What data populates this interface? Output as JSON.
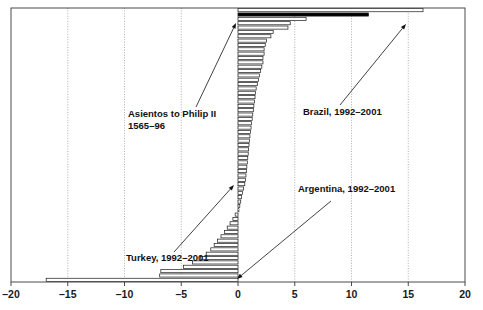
{
  "chart_data": {
    "type": "bar",
    "orientation": "horizontal",
    "title": "",
    "subtitle": "",
    "xlabel": "",
    "ylabel": "",
    "xlim": [
      -20,
      20
    ],
    "xticks": [
      -20,
      -15,
      -10,
      -5,
      0,
      5,
      10,
      15,
      20
    ],
    "xticklabels": [
      "–20",
      "–15",
      "–10",
      "–5",
      "0",
      "5",
      "10",
      "15",
      "20"
    ],
    "grid": "vertical-dotted",
    "legend": "none",
    "bar_fill": "#ffffff",
    "bar_edge": "#1a1a1a",
    "highlight_fill": "#000000",
    "categories": [
      "r01",
      "r02",
      "r03",
      "r04",
      "r05",
      "r06",
      "r07",
      "r08",
      "r09",
      "r10",
      "r11",
      "r12",
      "r13",
      "r14",
      "r15",
      "r16",
      "r17",
      "r18",
      "r19",
      "r20",
      "r21",
      "r22",
      "r23",
      "r24",
      "r25",
      "r26",
      "r27",
      "r28",
      "r29",
      "r30",
      "r31",
      "r32",
      "r33",
      "r34",
      "r35",
      "r36",
      "r37",
      "r38",
      "r39",
      "r40",
      "r41",
      "r42",
      "r43",
      "r44",
      "r45",
      "r46",
      "r47",
      "r48",
      "r49",
      "r50",
      "r51",
      "r52",
      "r53",
      "r54",
      "r55",
      "r56",
      "r57",
      "r58",
      "r59",
      "r60",
      "r61",
      "r62",
      "r63"
    ],
    "values": [
      16.3,
      11.5,
      6.0,
      4.6,
      4.4,
      3.1,
      2.9,
      2.5,
      2.4,
      2.3,
      2.3,
      2.2,
      2.2,
      2.1,
      2.0,
      1.9,
      1.8,
      1.7,
      1.6,
      1.55,
      1.5,
      1.45,
      1.4,
      1.35,
      1.3,
      1.25,
      1.2,
      1.15,
      1.1,
      1.05,
      1.0,
      0.97,
      0.94,
      0.9,
      0.86,
      0.82,
      0.78,
      0.74,
      0.7,
      0.66,
      0.6,
      0.5,
      0.4,
      0.32,
      0.24,
      0.16,
      0.08,
      -0.25,
      -0.45,
      -0.7,
      -0.95,
      -1.2,
      -1.5,
      -1.8,
      -2.1,
      -2.4,
      -2.8,
      -3.3,
      -4.0,
      -4.8,
      -6.8,
      -6.9,
      -16.9
    ],
    "highlight_index": 1,
    "annotations": [
      {
        "id": "asientos",
        "lines": [
          "Asientos to Philip II",
          "1565–96"
        ],
        "text_x": 128,
        "text_y": 117,
        "arrow_from_x": 196,
        "arrow_from_y": 107,
        "arrow_to_x": 236,
        "arrow_to_y": 23
      },
      {
        "id": "brazil",
        "lines": [
          "Brazil, 1992–2001"
        ],
        "text_x": 303,
        "text_y": 115,
        "arrow_from_x": 340,
        "arrow_from_y": 105,
        "arrow_to_x": 406,
        "arrow_to_y": 24
      },
      {
        "id": "turkey",
        "lines": [
          "Turkey, 1992–2001"
        ],
        "text_x": 126,
        "text_y": 261,
        "arrow_from_x": 174,
        "arrow_from_y": 252,
        "arrow_to_x": 234,
        "arrow_to_y": 185
      },
      {
        "id": "argentina",
        "lines": [
          "Argentina, 1992–2001"
        ],
        "text_x": 298,
        "text_y": 192,
        "arrow_from_x": 331,
        "arrow_from_y": 201,
        "arrow_to_x": 237,
        "arrow_to_y": 279
      }
    ]
  }
}
